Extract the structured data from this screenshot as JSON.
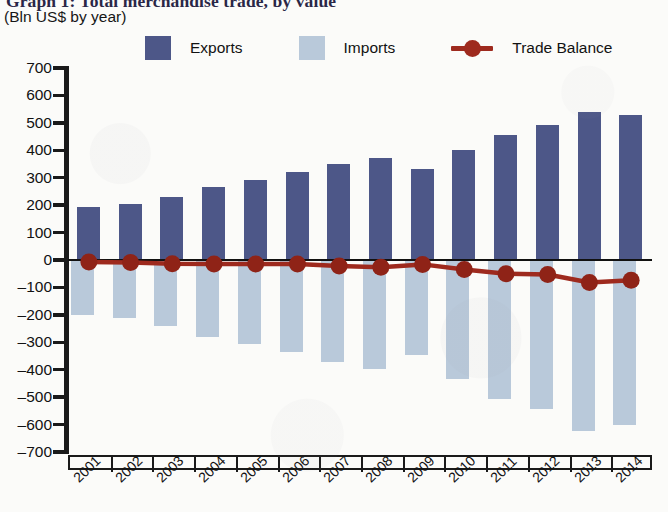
{
  "title": "Graph 1: Total merchandise trade, by value",
  "subtitle": "(Bln US$ by year)",
  "legend": {
    "exports_label": "Exports",
    "imports_label": "Imports",
    "balance_label": "Trade Balance"
  },
  "colors": {
    "exports": "#4d5788",
    "imports": "#b9c9da",
    "balance": "#9e2a1e",
    "axis": "#1a1a1a",
    "paper": "#fbfbf9",
    "title": "#2a2747"
  },
  "chart_data": {
    "type": "bar",
    "title": "Graph 1: Total merchandise trade, by value",
    "subtitle": "(Bln US$ by year)",
    "xlabel": "",
    "ylabel": "Bln US$",
    "ylim": [
      -700,
      700
    ],
    "ytick_step": 100,
    "yticks": [
      700,
      600,
      500,
      400,
      300,
      200,
      100,
      0,
      -100,
      -200,
      -300,
      -400,
      -500,
      -600,
      -700
    ],
    "ytick_labels": [
      "700",
      "600",
      "500",
      "400",
      "300",
      "200",
      "100",
      "0",
      "-100",
      "-200",
      "-300",
      "-400",
      "-500",
      "-600",
      "-700"
    ],
    "categories": [
      "2001",
      "2002",
      "2003",
      "2004",
      "2005",
      "2006",
      "2007",
      "2008",
      "2009",
      "2010",
      "2011",
      "2012",
      "2013",
      "2014"
    ],
    "grid": false,
    "legend_position": "top",
    "series": [
      {
        "name": "Exports",
        "type": "bar",
        "color": "#4d5788",
        "values": [
          193,
          203,
          228,
          265,
          290,
          322,
          350,
          372,
          332,
          400,
          455,
          492,
          540,
          528
        ]
      },
      {
        "name": "Imports",
        "type": "bar",
        "color": "#b9c9da",
        "values": [
          -200,
          -212,
          -242,
          -280,
          -305,
          -337,
          -372,
          -398,
          -348,
          -435,
          -505,
          -545,
          -622,
          -602
        ]
      },
      {
        "name": "Trade Balance",
        "type": "line",
        "color": "#9e2a1e",
        "values": [
          -7,
          -9,
          -14,
          -15,
          -15,
          -15,
          -22,
          -26,
          -16,
          -35,
          -50,
          -53,
          -82,
          -74
        ]
      }
    ]
  }
}
